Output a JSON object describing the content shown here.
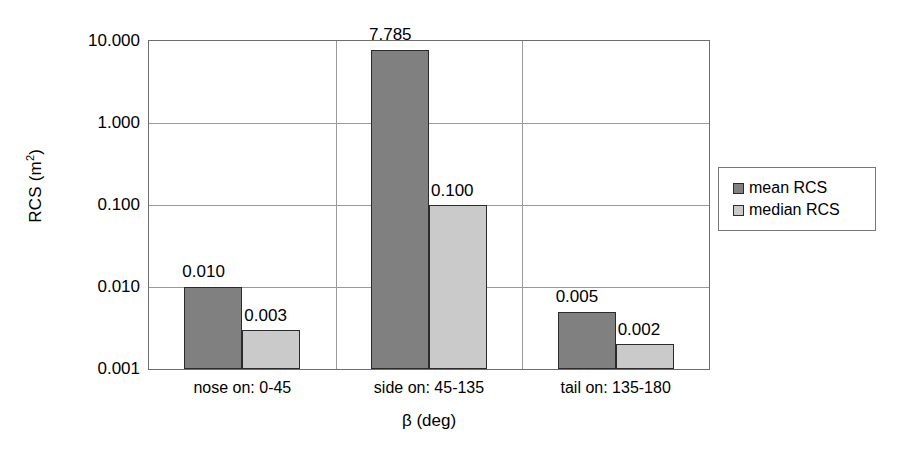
{
  "chart_data": {
    "type": "bar",
    "title": "",
    "xlabel": "β (deg)",
    "ylabel": "RCS (m2)",
    "ylabel_base": "RCS (m",
    "ylabel_sup": "2",
    "ylabel_tail": ")",
    "yscale": "log",
    "ylim": [
      0.001,
      10.0
    ],
    "grid": "horizontal-and-category-separators",
    "legend_position": "right",
    "categories": [
      "nose on:  0-45",
      "side on: 45-135",
      "tail on: 135-180"
    ],
    "ytick_labels": [
      "0.001",
      "0.010",
      "0.100",
      "1.000",
      "10.000"
    ],
    "ytick_values": [
      0.001,
      0.01,
      0.1,
      1.0,
      10.0
    ],
    "series": [
      {
        "name": "mean RCS",
        "color": "#808080",
        "values": [
          0.01,
          7.785,
          0.005
        ],
        "value_labels": [
          "0.010",
          "7.785",
          "0.005"
        ]
      },
      {
        "name": "median RCS",
        "color": "#cacaca",
        "values": [
          0.003,
          0.1,
          0.002
        ],
        "value_labels": [
          "0.003",
          "0.100",
          "0.002"
        ]
      }
    ]
  },
  "legend": {
    "items": [
      {
        "label": "mean RCS",
        "color": "#808080"
      },
      {
        "label": "median RCS",
        "color": "#cacaca"
      }
    ]
  },
  "colors": {
    "mean": "#808080",
    "median": "#cacaca",
    "axis": "#6e6e6e",
    "grid": "#9a9a9a",
    "bar_outline": "#2b2b2b",
    "background": "#ffffff"
  }
}
